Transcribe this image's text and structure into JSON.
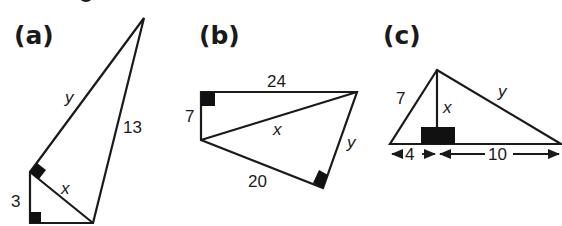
{
  "diagram": {
    "type": "geometry-right-triangles",
    "colors": {
      "ink": "#1a1a1a",
      "background": "#ffffff"
    },
    "panels": [
      {
        "id": "a",
        "label": "(a)",
        "description": "Two right triangles sharing side x; small triangle with leg 3 and right angle at bottom-left, large triangle with hypotenuse 13 and right angle where x meets y",
        "labels": {
          "y": "y",
          "hyp": "13",
          "x": "x",
          "leg": "3"
        }
      },
      {
        "id": "b",
        "label": "(b)",
        "description": "Quadrilateral split by diagonal x; upper right triangle with legs 7 and 24, lower right triangle with leg 20, leg y, hypotenuse x",
        "labels": {
          "top": "24",
          "left": "7",
          "diag": "x",
          "right": "y",
          "bottom": "20"
        }
      },
      {
        "id": "c",
        "label": "(c)",
        "description": "Triangle with altitude x to base; base split into segments 4 and 10; left side 7, right side y",
        "labels": {
          "left": "7",
          "alt": "x",
          "right": "y",
          "seg_left": "4",
          "seg_right": "10"
        }
      }
    ]
  }
}
